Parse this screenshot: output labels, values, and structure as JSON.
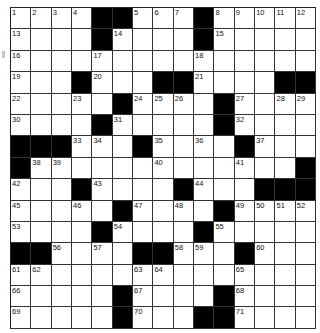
{
  "puzzle": {
    "rows": 15,
    "cols": 15,
    "colors": {
      "block": "#000000",
      "cell": "#ffffff",
      "line": "#333333"
    },
    "grid": [
      [
        1,
        2,
        3,
        4,
        "B",
        "B",
        5,
        6,
        7,
        "B",
        8,
        9,
        10,
        11,
        12
      ],
      [
        13,
        0,
        0,
        0,
        "B",
        14,
        0,
        0,
        0,
        "B",
        15,
        0,
        0,
        0,
        0
      ],
      [
        16,
        0,
        0,
        0,
        17,
        0,
        0,
        0,
        0,
        18,
        0,
        0,
        0,
        0,
        0
      ],
      [
        19,
        0,
        0,
        "B",
        20,
        0,
        0,
        "B",
        "B",
        21,
        0,
        0,
        0,
        "B",
        "B"
      ],
      [
        22,
        0,
        0,
        23,
        0,
        "B",
        24,
        25,
        26,
        0,
        "B",
        27,
        0,
        28,
        29
      ],
      [
        30,
        0,
        0,
        0,
        "B",
        31,
        0,
        0,
        0,
        0,
        "B",
        32,
        0,
        0,
        0
      ],
      [
        "B",
        "B",
        "B",
        33,
        34,
        0,
        "B",
        35,
        0,
        36,
        0,
        "B",
        37,
        0,
        0
      ],
      [
        "B",
        38,
        39,
        0,
        0,
        0,
        0,
        40,
        0,
        0,
        0,
        41,
        0,
        0,
        "B"
      ],
      [
        42,
        0,
        0,
        "B",
        43,
        0,
        0,
        0,
        "B",
        44,
        0,
        0,
        "B",
        "B",
        "B"
      ],
      [
        45,
        0,
        0,
        46,
        0,
        "B",
        47,
        0,
        48,
        0,
        "B",
        49,
        50,
        51,
        52
      ],
      [
        53,
        0,
        0,
        0,
        "B",
        54,
        0,
        0,
        0,
        "B",
        55,
        0,
        0,
        0,
        0
      ],
      [
        "B",
        "B",
        56,
        0,
        57,
        0,
        "B",
        "B",
        58,
        59,
        0,
        "B",
        60,
        0,
        0
      ],
      [
        61,
        62,
        0,
        0,
        0,
        0,
        63,
        64,
        0,
        0,
        0,
        65,
        0,
        0,
        0
      ],
      [
        66,
        0,
        0,
        0,
        0,
        "B",
        67,
        0,
        0,
        0,
        "B",
        68,
        0,
        0,
        0
      ],
      [
        69,
        0,
        0,
        0,
        0,
        "B",
        70,
        0,
        0,
        "B",
        "B",
        71,
        0,
        0,
        0
      ]
    ]
  }
}
